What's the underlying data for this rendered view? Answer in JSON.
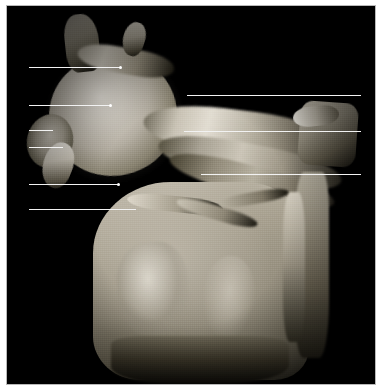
{
  "plate": {
    "kind": "anatomical-dissection-photograph",
    "subject": "shoulder region dissection with scapula and humeral head",
    "background_color": "#ffffff",
    "photo_background_color": "#000000",
    "frame_border_color": "#b9b9b9",
    "leader_line_color": "#f2f2f2",
    "label_text_color": "#000000",
    "width_px": 382,
    "height_px": 390
  },
  "callouts": {
    "left": [
      {
        "number": "9",
        "x": 17,
        "y": 62,
        "line_start": 28,
        "line_end": 120,
        "line_y": 66,
        "dot": true
      },
      {
        "number": "8",
        "x": 17,
        "y": 99,
        "line_start": 28,
        "line_end": 110,
        "line_y": 104,
        "dot": true
      },
      {
        "number": "7",
        "x": 17,
        "y": 124,
        "line_start": 28,
        "line_end": 52,
        "line_y": 129,
        "dot": false
      },
      {
        "number": "6",
        "x": 17,
        "y": 141,
        "line_start": 28,
        "line_end": 62,
        "line_y": 146,
        "dot": false
      },
      {
        "number": "5",
        "x": 17,
        "y": 178,
        "line_start": 28,
        "line_end": 118,
        "line_y": 183,
        "dot": true
      },
      {
        "number": "4",
        "x": 17,
        "y": 203,
        "line_start": 28,
        "line_end": 135,
        "line_y": 208,
        "dot": false
      }
    ],
    "right": [
      {
        "number": "1",
        "x": 366,
        "y": 90,
        "line_start": 186,
        "line_end": 360,
        "line_y": 94,
        "dot": false
      },
      {
        "number": "2",
        "x": 366,
        "y": 126,
        "line_start": 183,
        "line_end": 360,
        "line_y": 130,
        "dot": false
      },
      {
        "number": "3",
        "x": 366,
        "y": 169,
        "line_start": 200,
        "line_end": 360,
        "line_y": 173,
        "dot": false
      }
    ]
  }
}
